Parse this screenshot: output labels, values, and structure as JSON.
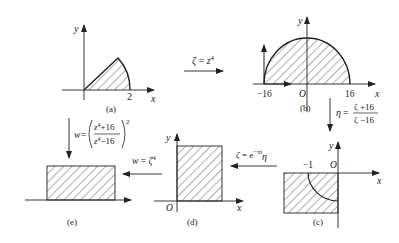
{
  "diagram": {
    "colors": {
      "stroke": "#222222",
      "hatch": "#333333",
      "background": "#ffffff"
    },
    "panels": {
      "a": {
        "label": "(a)",
        "y_axis": "y",
        "x_axis": "x",
        "tick": "2",
        "shape": "sector 0..π/4 radius 2"
      },
      "b": {
        "label": "(b)",
        "y_axis": "y",
        "x_axis": "x",
        "origin": "O",
        "tick_left": "−16",
        "tick_right": "16",
        "shape": "upper half-disk radius 16"
      },
      "c": {
        "label": "(c)",
        "y_axis": "y",
        "x_axis": "x",
        "origin": "O",
        "tick": "−1",
        "shape": "third-quadrant region with unit arc"
      },
      "d": {
        "label": "(d)",
        "y_axis": "y",
        "x_axis": "x",
        "origin": "O",
        "shape": "first-quadrant rectangle"
      },
      "e": {
        "label": "(e)",
        "shape": "rectangle"
      }
    },
    "mappings": {
      "a_to_b": {
        "lhs": "ζ",
        "eq": " = ",
        "rhs": "z",
        "sup": "4"
      },
      "b_to_c": {
        "lhs": "η",
        "eq": "=",
        "num": "ζ +16",
        "den": "ζ −16"
      },
      "c_to_d": {
        "lhs": "ζ",
        "eq": " = e",
        "sup": "−πi",
        "rhs": "η"
      },
      "d_to_e": {
        "lhs": "w",
        "eq": " = ",
        "rhs": "ζ",
        "sup": "4"
      },
      "a_to_e": {
        "lhs": "w",
        "eq": "=",
        "num_base": "z",
        "num_sup": "4",
        "num_rest": "+16",
        "den_base": "z",
        "den_sup": "4",
        "den_rest": "−16",
        "outer_sup": "2"
      }
    }
  }
}
